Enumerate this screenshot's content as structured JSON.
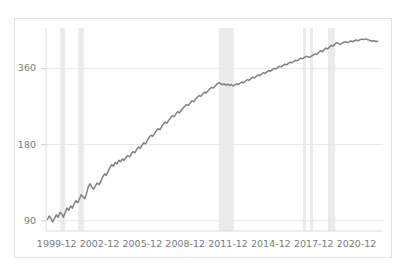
{
  "title_faint": "· · · ·",
  "chart_data": {
    "type": "line",
    "title": "",
    "subtitle": "",
    "xlabel": "",
    "ylabel": "",
    "yscale": "log",
    "ylim": [
      82,
      520
    ],
    "grid": true,
    "gridlines_y": [
      90,
      180,
      360
    ],
    "legend": "none",
    "y_ticks": [
      {
        "value": 90,
        "label": "90"
      },
      {
        "value": 180,
        "label": "180"
      },
      {
        "value": 360,
        "label": "360"
      }
    ],
    "x_ticks": [
      {
        "value": 1999.95,
        "label": "1999-12"
      },
      {
        "value": 2002.95,
        "label": "2002-12"
      },
      {
        "value": 2005.95,
        "label": "2005-12"
      },
      {
        "value": 2008.95,
        "label": "2008-12"
      },
      {
        "value": 2011.95,
        "label": "2011-12"
      },
      {
        "value": 2014.95,
        "label": "2014-12"
      },
      {
        "value": 2017.95,
        "label": "2017-12"
      },
      {
        "value": 2020.95,
        "label": "2020-12"
      }
    ],
    "xlim": [
      1999.2,
      2022.8
    ],
    "line_color": "#808080",
    "band_color": "#ebebeb",
    "grid_color": "#e8e8e8",
    "shaded_bands": [
      {
        "start": 2000.2,
        "end": 2000.55
      },
      {
        "start": 2001.45,
        "end": 2001.85
      },
      {
        "start": 2011.3,
        "end": 2012.35
      },
      {
        "start": 2017.2,
        "end": 2017.4
      },
      {
        "start": 2017.7,
        "end": 2017.9
      },
      {
        "start": 2018.95,
        "end": 2019.45
      }
    ],
    "series": [
      {
        "name": "index",
        "x": [
          1999.3,
          1999.42,
          1999.55,
          1999.67,
          1999.8,
          1999.92,
          2000.05,
          2000.17,
          2000.3,
          2000.42,
          2000.55,
          2000.67,
          2000.8,
          2000.92,
          2001.05,
          2001.17,
          2001.3,
          2001.42,
          2001.55,
          2001.67,
          2001.8,
          2001.92,
          2002.05,
          2002.17,
          2002.3,
          2002.42,
          2002.55,
          2002.67,
          2002.8,
          2002.92,
          2003.05,
          2003.17,
          2003.3,
          2003.42,
          2003.55,
          2003.67,
          2003.8,
          2003.92,
          2004.05,
          2004.17,
          2004.3,
          2004.42,
          2004.55,
          2004.67,
          2004.8,
          2004.92,
          2005.05,
          2005.17,
          2005.3,
          2005.42,
          2005.55,
          2005.67,
          2005.8,
          2005.92,
          2006.05,
          2006.17,
          2006.3,
          2006.42,
          2006.55,
          2006.67,
          2006.8,
          2006.92,
          2007.05,
          2007.17,
          2007.3,
          2007.42,
          2007.55,
          2007.67,
          2007.8,
          2007.92,
          2008.05,
          2008.17,
          2008.3,
          2008.42,
          2008.55,
          2008.67,
          2008.8,
          2008.92,
          2009.05,
          2009.17,
          2009.3,
          2009.42,
          2009.55,
          2009.67,
          2009.8,
          2009.92,
          2010.05,
          2010.17,
          2010.3,
          2010.42,
          2010.55,
          2010.67,
          2010.8,
          2010.92,
          2011.05,
          2011.17,
          2011.3,
          2011.42,
          2011.55,
          2011.67,
          2011.8,
          2011.92,
          2012.05,
          2012.17,
          2012.3,
          2012.42,
          2012.55,
          2012.67,
          2012.8,
          2012.92,
          2013.05,
          2013.17,
          2013.3,
          2013.42,
          2013.55,
          2013.67,
          2013.8,
          2013.92,
          2014.05,
          2014.17,
          2014.3,
          2014.42,
          2014.55,
          2014.67,
          2014.8,
          2014.92,
          2015.05,
          2015.17,
          2015.3,
          2015.42,
          2015.55,
          2015.67,
          2015.8,
          2015.92,
          2016.05,
          2016.17,
          2016.3,
          2016.42,
          2016.55,
          2016.67,
          2016.8,
          2016.92,
          2017.05,
          2017.17,
          2017.3,
          2017.42,
          2017.55,
          2017.67,
          2017.8,
          2017.92,
          2018.05,
          2018.17,
          2018.3,
          2018.42,
          2018.55,
          2018.67,
          2018.8,
          2018.92,
          2019.05,
          2019.17,
          2019.3,
          2019.42,
          2019.55,
          2019.67,
          2019.8,
          2019.92,
          2020.05,
          2020.17,
          2020.3,
          2020.42,
          2020.55,
          2020.67,
          2020.8,
          2020.92,
          2021.05,
          2021.17,
          2021.3,
          2021.42,
          2021.55,
          2021.67,
          2021.8,
          2021.92,
          2022.05,
          2022.17,
          2022.3,
          2022.42
        ],
        "y": [
          91,
          94,
          92,
          89,
          92,
          95,
          93,
          97,
          96,
          93,
          97,
          101,
          99,
          103,
          101,
          105,
          108,
          106,
          110,
          114,
          112,
          110,
          116,
          123,
          126,
          122,
          120,
          124,
          127,
          125,
          129,
          134,
          138,
          136,
          141,
          146,
          150,
          148,
          153,
          151,
          156,
          154,
          158,
          156,
          160,
          163,
          161,
          165,
          169,
          167,
          172,
          176,
          174,
          179,
          183,
          181,
          187,
          192,
          196,
          194,
          199,
          204,
          208,
          206,
          212,
          217,
          221,
          219,
          225,
          230,
          234,
          232,
          238,
          243,
          240,
          246,
          251,
          255,
          259,
          257,
          263,
          268,
          266,
          272,
          277,
          281,
          279,
          285,
          290,
          288,
          294,
          299,
          303,
          301,
          307,
          312,
          316,
          314,
          310,
          313,
          309,
          312,
          308,
          311,
          307,
          310,
          313,
          311,
          315,
          318,
          316,
          321,
          325,
          323,
          328,
          332,
          330,
          335,
          339,
          337,
          342,
          346,
          344,
          349,
          353,
          351,
          356,
          360,
          358,
          363,
          367,
          365,
          370,
          374,
          372,
          377,
          381,
          379,
          384,
          388,
          386,
          391,
          395,
          393,
          398,
          402,
          400,
          398,
          403,
          407,
          411,
          409,
          416,
          423,
          419,
          426,
          433,
          430,
          437,
          444,
          441,
          448,
          455,
          452,
          448,
          452,
          456,
          459,
          455,
          458,
          462,
          459,
          463,
          466,
          463,
          467,
          470,
          468,
          471,
          469,
          466,
          464,
          461,
          463,
          460,
          461
        ]
      }
    ]
  }
}
